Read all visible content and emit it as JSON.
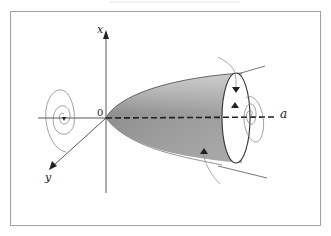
{
  "figure": {
    "labels": {
      "x_axis": "x",
      "y_axis": "y",
      "origin": "0",
      "rotation_axis": "a"
    },
    "colors": {
      "frame": "#9a9a9a",
      "line": "#333333",
      "thin_line": "#7a7a7a",
      "shade_dark": "#8c8c8c",
      "shade_light": "#d4d4d4"
    }
  }
}
